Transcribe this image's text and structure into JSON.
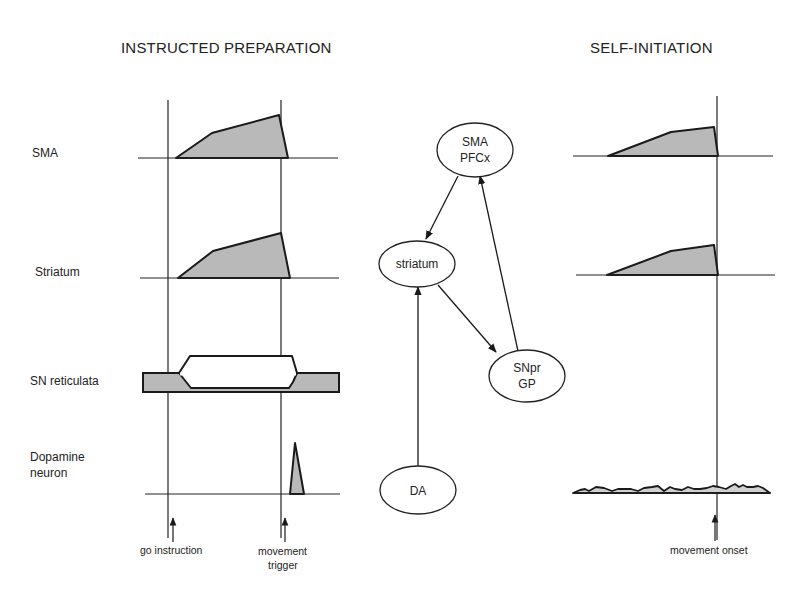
{
  "left_panel": {
    "title": "INSTRUCTED PREPARATION",
    "rows": [
      {
        "label": "SMA"
      },
      {
        "label": "Striatum"
      },
      {
        "label": "SN reticulata"
      },
      {
        "label_line1": "Dopamine",
        "label_line2": "neuron"
      }
    ],
    "events": [
      {
        "label": "go instruction"
      },
      {
        "label_line1": "movement",
        "label_line2": "trigger"
      }
    ]
  },
  "right_panel": {
    "title": "SELF-INITIATION",
    "events": [
      {
        "label": "movement onset"
      }
    ]
  },
  "network": {
    "nodes": [
      {
        "id": "sma_pfcx",
        "line1": "SMA",
        "line2": "PFCx"
      },
      {
        "id": "striatum",
        "line1": "striatum"
      },
      {
        "id": "snpr_gp",
        "line1": "SNpr",
        "line2": "GP"
      },
      {
        "id": "da",
        "line1": "DA"
      }
    ],
    "edges": [
      {
        "from": "sma_pfcx",
        "to": "striatum"
      },
      {
        "from": "striatum",
        "to": "snpr_gp"
      },
      {
        "from": "snpr_gp",
        "to": "sma_pfcx"
      },
      {
        "from": "da",
        "to": "striatum"
      }
    ]
  },
  "colors": {
    "shade": "#b9b9b9",
    "ink": "#222222",
    "background": "#ffffff"
  }
}
